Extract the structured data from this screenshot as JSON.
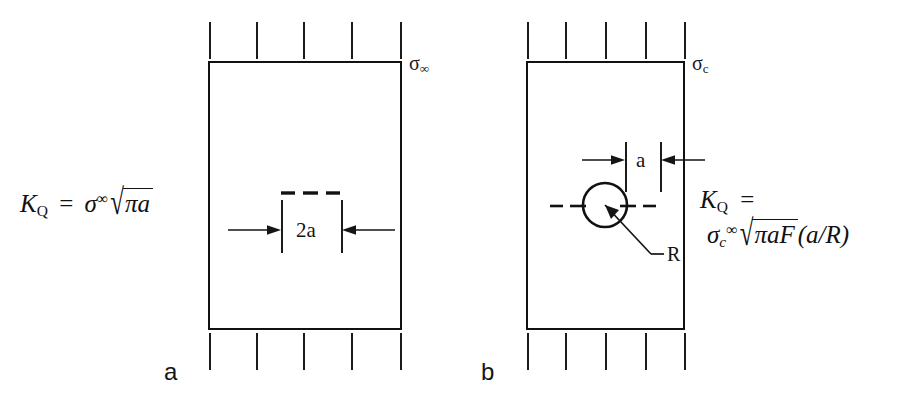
{
  "figure": {
    "background_color": "#ffffff",
    "line_color": "#111111",
    "panels": [
      {
        "id": "panel-a",
        "letter": "a",
        "description": "center-cracked plate under remote tension",
        "stress_label": {
          "symbol": "σ",
          "subscript": "∞"
        },
        "dimension_label": "2a",
        "formula": {
          "lhs": "K",
          "lhs_sub": "Q",
          "equals": "=",
          "stress": "σ",
          "stress_sup": "∞",
          "radicand": "πa"
        },
        "tick_count_top": 5,
        "tick_count_bottom": 5
      },
      {
        "id": "panel-b",
        "letter": "b",
        "description": "circular hole with radial crack under tension",
        "stress_label": {
          "symbol": "σ",
          "subscript": "c"
        },
        "dimension_label": "a",
        "radius_label": "R",
        "formula": {
          "lhs": "K",
          "lhs_sub": "Q",
          "equals": "=",
          "stress": "σ",
          "stress_sub": "c",
          "stress_sup": "∞",
          "radicand": "πaF",
          "argument": "(a/R)"
        },
        "tick_count_top": 5,
        "tick_count_bottom": 5
      }
    ]
  }
}
